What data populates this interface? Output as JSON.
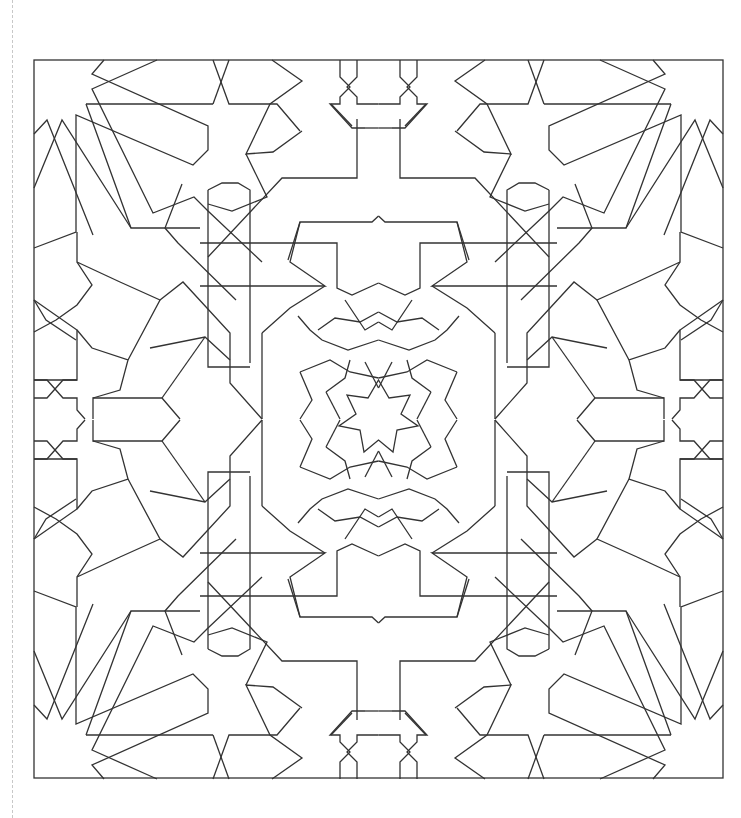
{
  "figure": {
    "stroke_color": "#333333",
    "background_color": "#ffffff",
    "border": {
      "x": 34,
      "y": 60,
      "width": 689,
      "height": 718
    },
    "center": {
      "x": 378.5,
      "y": 419.5
    },
    "symmetry": "4-fold mirror (horizontal and vertical axes)"
  }
}
